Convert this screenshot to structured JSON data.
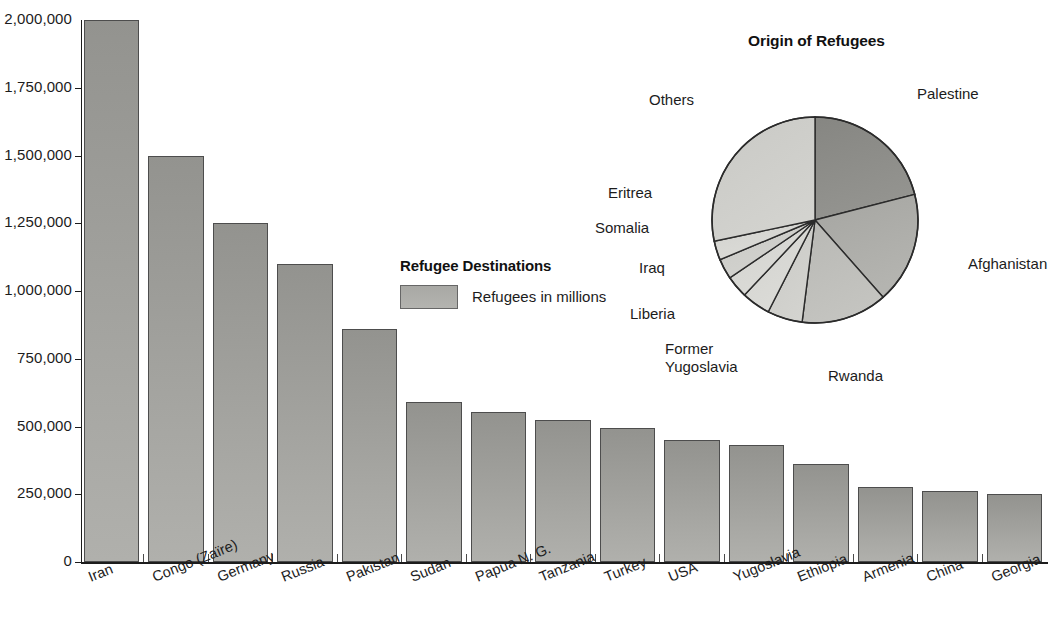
{
  "chart_data": [
    {
      "type": "bar",
      "title": "",
      "xlabel": "",
      "ylabel": "",
      "ylim": [
        0,
        2000000
      ],
      "grid": false,
      "legend_position": "inside-upper-middle",
      "legend_title": "Refugee Destinations",
      "legend_entries": [
        "Refugees in millions"
      ],
      "ytick_labels": [
        "2,000,000",
        "1,750,000",
        "1,500,000",
        "1,250,000",
        "1,000,000",
        "750,000",
        "500,000",
        "250,000",
        "0"
      ],
      "ytick_values": [
        2000000,
        1750000,
        1500000,
        1250000,
        1000000,
        750000,
        500000,
        250000,
        0
      ],
      "categories": [
        "Iran",
        "Congo (Zaïre)",
        "Germany",
        "Russia",
        "Pakistan",
        "Sudan",
        "Papua N. G.",
        "Tanzania",
        "Turkey",
        "USA",
        "Yugoslavia",
        "Ethiopia",
        "Armenia",
        "China",
        "Georgia"
      ],
      "values": [
        2000000,
        1500000,
        1250000,
        1100000,
        860000,
        590000,
        555000,
        525000,
        495000,
        450000,
        430000,
        360000,
        275000,
        262000,
        252000
      ]
    },
    {
      "type": "pie",
      "title": "Origin of Refugees",
      "labels": [
        "Palestine",
        "Afghanistan",
        "Rwanda",
        "Former Yugoslavia",
        "Liberia",
        "Iraq",
        "Somalia",
        "Eritrea",
        "Others"
      ],
      "values": [
        21,
        17.5,
        13.5,
        5.5,
        4.5,
        3.5,
        3.2,
        3.0,
        28.3
      ],
      "start_angle_deg": 0,
      "direction": "clockwise"
    }
  ],
  "bar_chart": {
    "legend": {
      "title": "Refugee Destinations",
      "entry_label": "Refugees in millions"
    },
    "y_axis": {
      "ticks": [
        {
          "label": "2,000,000"
        },
        {
          "label": "1,750,000"
        },
        {
          "label": "1,500,000"
        },
        {
          "label": "1,250,000"
        },
        {
          "label": "1,000,000"
        },
        {
          "label": "750,000"
        },
        {
          "label": "500,000"
        },
        {
          "label": "250,000"
        },
        {
          "label": "0"
        }
      ]
    },
    "bars": [
      {
        "label": "Iran",
        "value": 2000000
      },
      {
        "label": "Congo (Zaïre)",
        "value": 1500000
      },
      {
        "label": "Germany",
        "value": 1250000
      },
      {
        "label": "Russia",
        "value": 1100000
      },
      {
        "label": "Pakistan",
        "value": 860000
      },
      {
        "label": "Sudan",
        "value": 590000
      },
      {
        "label": "Papua N. G.",
        "value": 555000
      },
      {
        "label": "Tanzania",
        "value": 525000
      },
      {
        "label": "Turkey",
        "value": 495000
      },
      {
        "label": "USA",
        "value": 450000
      },
      {
        "label": "Yugoslavia",
        "value": 430000
      },
      {
        "label": "Ethiopia",
        "value": 360000
      },
      {
        "label": "Armenia",
        "value": 275000
      },
      {
        "label": "China",
        "value": 262000
      },
      {
        "label": "Georgia",
        "value": 252000
      }
    ]
  },
  "pie_chart": {
    "title": "Origin of Refugees",
    "slices": [
      {
        "label": "Palestine",
        "value": 21
      },
      {
        "label": "Afghanistan",
        "value": 17.5
      },
      {
        "label": "Rwanda",
        "value": 13.5
      },
      {
        "label": "Former Yugoslavia",
        "value": 5.5
      },
      {
        "label": "Liberia",
        "value": 4.5
      },
      {
        "label": "Iraq",
        "value": 3.5
      },
      {
        "label": "Somalia",
        "value": 3.2
      },
      {
        "label": "Eritrea",
        "value": 3.0
      },
      {
        "label": "Others",
        "value": 28.3
      }
    ],
    "label_lines": {
      "former_yugoslavia_line1": "Former",
      "former_yugoslavia_line2": "Yugoslavia"
    }
  },
  "colors": {
    "bar_fill": "#a0a09c",
    "bar_stroke": "#4d4d4d",
    "axis": "#1c1c1c",
    "text": "#1c1c1c",
    "pie_dark": "#8a8a8a",
    "pie_mid": "#a8a8a4",
    "pie_light": "#cdcdcd",
    "background": "#ffffff"
  }
}
